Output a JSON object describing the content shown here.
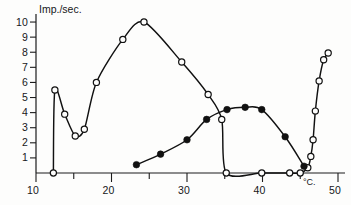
{
  "figure": {
    "y_axis_title": "Imp./sec.",
    "x_axis_unit": "°C.",
    "y_ticks": [
      "1",
      "2",
      "3",
      "4",
      "5",
      "6",
      "7",
      "8",
      "9",
      "10"
    ],
    "x_ticks": [
      "10",
      "20",
      "30",
      "40",
      "50"
    ]
  },
  "chart_data": {
    "type": "line",
    "title": "",
    "subtitle": "",
    "xlabel": "°C.",
    "ylabel": "Imp./sec.",
    "xlim": [
      10,
      50
    ],
    "ylim": [
      0,
      10.4
    ],
    "grid": false,
    "legend_position": "none",
    "x_ticks": [
      10,
      20,
      30,
      40,
      50
    ],
    "y_ticks": [
      1,
      2,
      3,
      4,
      5,
      6,
      7,
      8,
      9,
      10
    ],
    "annotations": [
      "°C."
    ],
    "series": [
      {
        "name": "open-circle-curve",
        "marker": "open-circle",
        "points": [
          {
            "x": 12.3,
            "y": 0.0
          },
          {
            "x": 12.5,
            "y": 5.5
          },
          {
            "x": 13.8,
            "y": 3.9
          },
          {
            "x": 15.2,
            "y": 2.45
          },
          {
            "x": 16.4,
            "y": 2.9
          },
          {
            "x": 18.0,
            "y": 6.0
          },
          {
            "x": 21.5,
            "y": 8.85
          },
          {
            "x": 24.3,
            "y": 10.0
          },
          {
            "x": 29.3,
            "y": 7.35
          },
          {
            "x": 32.8,
            "y": 5.2
          },
          {
            "x": 34.6,
            "y": 3.55
          },
          {
            "x": 35.2,
            "y": 0.0
          },
          {
            "x": 39.9,
            "y": 0.0
          },
          {
            "x": 43.6,
            "y": 0.0
          },
          {
            "x": 45.0,
            "y": 0.0
          },
          {
            "x": 46.0,
            "y": 0.35
          },
          {
            "x": 46.4,
            "y": 1.1
          },
          {
            "x": 46.7,
            "y": 2.2
          },
          {
            "x": 47.0,
            "y": 4.1
          },
          {
            "x": 47.5,
            "y": 6.1
          },
          {
            "x": 48.1,
            "y": 7.5
          },
          {
            "x": 48.7,
            "y": 7.95
          }
        ]
      },
      {
        "name": "filled-circle-curve",
        "marker": "filled-circle",
        "points": [
          {
            "x": 23.3,
            "y": 0.55
          },
          {
            "x": 26.5,
            "y": 1.25
          },
          {
            "x": 30.0,
            "y": 2.2
          },
          {
            "x": 32.6,
            "y": 3.55
          },
          {
            "x": 35.3,
            "y": 4.2
          },
          {
            "x": 37.7,
            "y": 4.35
          },
          {
            "x": 39.9,
            "y": 4.2
          },
          {
            "x": 43.0,
            "y": 2.4
          },
          {
            "x": 45.5,
            "y": 0.45
          }
        ]
      }
    ]
  }
}
